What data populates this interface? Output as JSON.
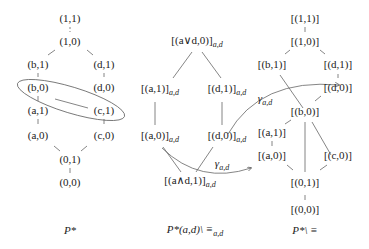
{
  "diagrams": [
    {
      "caption": "P*",
      "nodes": [
        {
          "id": "11",
          "label": "(1,1)"
        },
        {
          "id": "10",
          "label": "(1,0)"
        },
        {
          "id": "b1",
          "label": "(b,1)"
        },
        {
          "id": "d1",
          "label": "(d,1)"
        },
        {
          "id": "b0",
          "label": "(b,0)"
        },
        {
          "id": "d0",
          "label": "(d,0)"
        },
        {
          "id": "a1",
          "label": "(a,1)"
        },
        {
          "id": "c1",
          "label": "(c,1)"
        },
        {
          "id": "a0",
          "label": "(a,0)"
        },
        {
          "id": "c0",
          "label": "(c,0)"
        },
        {
          "id": "01",
          "label": "(0,1)"
        },
        {
          "id": "00",
          "label": "(0,0)"
        }
      ],
      "annotation": "ellipse around (b,0) and (c,1)"
    },
    {
      "caption": "P*(a,d)\\ ≡a,d",
      "caption_main": "P*(a,d)\\ ≡",
      "caption_sub": "a,d",
      "nodes": [
        {
          "id": "top",
          "label": "[(a∨d,0)]",
          "sub": "a,d"
        },
        {
          "id": "a1",
          "label": "[(a,1)]",
          "sub": "a,d"
        },
        {
          "id": "d1",
          "label": "[(d,1)]",
          "sub": "a,d"
        },
        {
          "id": "a0",
          "label": "[(a,0)]",
          "sub": "a,d"
        },
        {
          "id": "d0",
          "label": "[(d,0)]",
          "sub": "a,d"
        },
        {
          "id": "bot",
          "label": "[(a∧d,1)]",
          "sub": "a,d"
        }
      ],
      "maps": [
        {
          "label": "γ",
          "sub": "a,d",
          "from": "[(d,0)]a,d",
          "to": "[(d,0)]"
        },
        {
          "label": "γ",
          "sub": "a,d",
          "from": "[(a,0)]a,d",
          "to": "[(a,0)]"
        }
      ]
    },
    {
      "caption": "P*\\ ≡",
      "nodes": [
        {
          "id": "11",
          "label": "[(1,1)]"
        },
        {
          "id": "10",
          "label": "[(1,0)]"
        },
        {
          "id": "b1",
          "label": "[(b,1)]"
        },
        {
          "id": "d1",
          "label": "[(d,1)]"
        },
        {
          "id": "d0",
          "label": "[(d,0)]"
        },
        {
          "id": "b0",
          "label": "[(b,0)]"
        },
        {
          "id": "a1",
          "label": "[(a,1)]"
        },
        {
          "id": "a0",
          "label": "[(a,0)]"
        },
        {
          "id": "c0",
          "label": "[(c,0)]"
        },
        {
          "id": "01",
          "label": "[(0,1)]"
        },
        {
          "id": "00",
          "label": "[(0,0)]"
        }
      ]
    }
  ]
}
